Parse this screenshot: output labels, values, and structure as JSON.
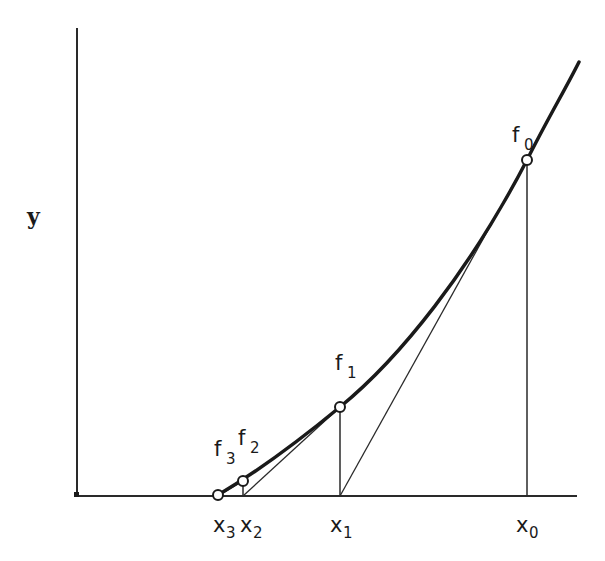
{
  "diagram": {
    "y_axis_label": "y",
    "colors": {
      "ink": "#1a1a1a",
      "background": "#ffffff"
    },
    "points": [
      {
        "id": "f0",
        "label_main": "f",
        "label_sub": "0",
        "x_label_main": "x",
        "x_label_sub": "0",
        "px": 527,
        "py": 160
      },
      {
        "id": "f1",
        "label_main": "f",
        "label_sub": "1",
        "x_label_main": "x",
        "x_label_sub": "1",
        "px": 340,
        "py": 407
      },
      {
        "id": "f2",
        "label_main": "f",
        "label_sub": "2",
        "x_label_main": "x",
        "x_label_sub": "2",
        "px": 243,
        "py": 481
      },
      {
        "id": "f3",
        "label_main": "f",
        "label_sub": "3",
        "x_label_main": "x",
        "x_label_sub": "3",
        "px": 218,
        "py": 495
      }
    ],
    "tangents": [
      {
        "from": "f0",
        "to_x": "x1"
      },
      {
        "from": "f1",
        "to_x": "x2"
      },
      {
        "from": "f2",
        "to_x": "x3"
      }
    ]
  }
}
